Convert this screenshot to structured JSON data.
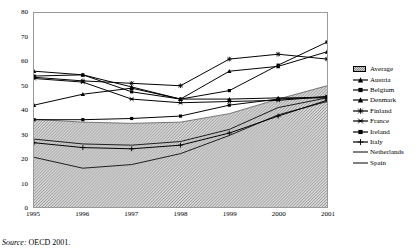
{
  "chart_data": {
    "type": "line",
    "title": "",
    "xlabel": "",
    "ylabel": "",
    "x": [
      "1995",
      "1996",
      "1997",
      "1998",
      "1999",
      "2000",
      "2001"
    ],
    "xlim": [
      "1995",
      "2001"
    ],
    "ylim": [
      0,
      80
    ],
    "ytick_labels": [
      "0",
      "10",
      "20",
      "30",
      "40",
      "50",
      "60",
      "70",
      "80"
    ],
    "ytick_values": [
      0,
      10,
      20,
      30,
      40,
      50,
      60,
      70,
      80
    ],
    "grid": false,
    "legend_position": "right",
    "source": "Source: OECD 2001.",
    "source_prefix": "Source:",
    "source_text": "OECD 2001.",
    "band": {
      "name": "Average",
      "type": "area",
      "marker": "hatched-swatch",
      "values": [
        36.2,
        35.0,
        34.5,
        35.0,
        38.5,
        44.5,
        50.0
      ]
    },
    "series": [
      {
        "name": "Austria",
        "marker": "triangle",
        "values": [
          42.0,
          46.5,
          49.0,
          44.5,
          56.0,
          58.0,
          64.0
        ]
      },
      {
        "name": "Belgium",
        "marker": "square",
        "values": [
          54.0,
          54.5,
          47.5,
          44.5,
          48.0,
          58.5,
          68.0
        ]
      },
      {
        "name": "Denmark",
        "marker": "triangle",
        "values": [
          56.0,
          54.5,
          49.5,
          44.5,
          44.5,
          45.0,
          45.0
        ]
      },
      {
        "name": "Finland",
        "marker": "asterisk",
        "values": [
          53.5,
          52.0,
          51.0,
          50.0,
          61.0,
          63.0,
          61.0
        ]
      },
      {
        "name": "France",
        "marker": "star",
        "values": [
          53.0,
          51.5,
          44.5,
          43.0,
          43.5,
          44.0,
          45.5
        ]
      },
      {
        "name": "Ireland",
        "marker": "square",
        "values": [
          36.0,
          36.0,
          36.5,
          37.5,
          42.0,
          44.5,
          45.5
        ]
      },
      {
        "name": "Italy",
        "marker": "plus",
        "values": [
          26.5,
          24.5,
          24.0,
          25.5,
          30.5,
          37.5,
          44.0
        ]
      },
      {
        "name": "Netherlands",
        "marker": "line",
        "values": [
          28.0,
          26.0,
          25.5,
          27.0,
          32.0,
          41.0,
          45.0
        ]
      },
      {
        "name": "Spain",
        "marker": "line",
        "values": [
          20.5,
          16.0,
          17.5,
          22.0,
          29.5,
          38.0,
          43.5
        ]
      }
    ]
  },
  "legend": {
    "items": [
      {
        "label": "Average",
        "marker": "hatched-swatch"
      },
      {
        "label": "Austria",
        "marker": "triangle"
      },
      {
        "label": "Belgium",
        "marker": "square"
      },
      {
        "label": "Denmark",
        "marker": "triangle"
      },
      {
        "label": "Finland",
        "marker": "asterisk"
      },
      {
        "label": "France",
        "marker": "star"
      },
      {
        "label": "Ireland",
        "marker": "square"
      },
      {
        "label": "Italy",
        "marker": "plus"
      },
      {
        "label": "Netherlands",
        "marker": "line"
      },
      {
        "label": "Spain",
        "marker": "line"
      }
    ]
  },
  "colors": {
    "line": "#000000",
    "band_fill": "#d2d2d2",
    "band_hatch": "#8d8d8d",
    "frame": "#9a9a9a",
    "background": "#ffffff"
  }
}
